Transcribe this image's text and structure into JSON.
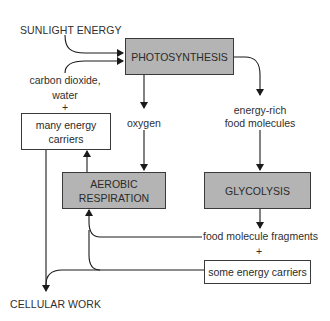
{
  "diagram": {
    "inputs": {
      "sunlight": "SUNLIGHT ENERGY",
      "co2_line1": "carbon dioxide,",
      "co2_line2": "water",
      "plus_top": "+"
    },
    "processes": {
      "photosynthesis": "PHOTOSYNTHESIS",
      "aerobic_line1": "AEROBIC",
      "aerobic_line2": "RESPIRATION",
      "glycolysis": "GLYCOLYSIS"
    },
    "products": {
      "oxygen": "oxygen",
      "food_line1": "energy-rich",
      "food_line2": "food molecules",
      "fragments": "food molecule fragments",
      "plus_bottom": "+",
      "many_carriers_line1": "many energy",
      "many_carriers_line2": "carriers",
      "some_carriers": "some energy carriers"
    },
    "output": {
      "cellular_work": "CELLULAR WORK"
    },
    "colors": {
      "process_fill": "#b4b4b4",
      "line": "#1a1a1a",
      "background": "#ffffff"
    }
  }
}
